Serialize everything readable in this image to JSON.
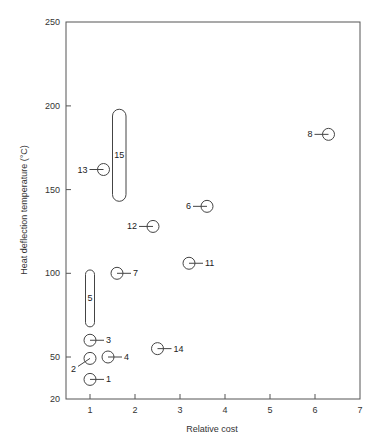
{
  "chart_data": {
    "type": "scatter",
    "title": "",
    "xlabel": "Relative cost",
    "ylabel": "Heat deflection temperature (°C)",
    "xlim": [
      0.45,
      7
    ],
    "ylim": [
      20,
      250
    ],
    "x_ticks": [
      1,
      2,
      3,
      4,
      5,
      6,
      7
    ],
    "y_ticks": [
      20,
      50,
      100,
      150,
      200,
      250
    ],
    "grid": false,
    "legend": null,
    "points": [
      {
        "label": "1",
        "x": 1.0,
        "y": 34,
        "label_side": "right"
      },
      {
        "label": "2",
        "x": 1.0,
        "y": 49,
        "label_side": "lower-left"
      },
      {
        "label": "3",
        "x": 1.0,
        "y": 60,
        "label_side": "right"
      },
      {
        "label": "4",
        "x": 1.4,
        "y": 50,
        "label_side": "right"
      },
      {
        "label": "6",
        "x": 3.6,
        "y": 140,
        "label_side": "left"
      },
      {
        "label": "7",
        "x": 1.6,
        "y": 100,
        "label_side": "right"
      },
      {
        "label": "8",
        "x": 6.3,
        "y": 183,
        "label_side": "left"
      },
      {
        "label": "11",
        "x": 3.2,
        "y": 106,
        "label_side": "right"
      },
      {
        "label": "12",
        "x": 2.4,
        "y": 128,
        "label_side": "left"
      },
      {
        "label": "13",
        "x": 1.3,
        "y": 162,
        "label_side": "left"
      },
      {
        "label": "14",
        "x": 2.5,
        "y": 55,
        "label_side": "right"
      }
    ],
    "ranges": [
      {
        "label": "5",
        "x_min": 0.9,
        "x_max": 1.1,
        "y_min": 68,
        "y_max": 102
      },
      {
        "label": "15",
        "x_min": 1.5,
        "x_max": 1.8,
        "y_min": 143,
        "y_max": 198
      }
    ]
  }
}
